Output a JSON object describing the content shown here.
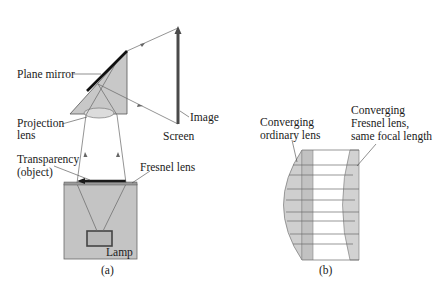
{
  "figure_a": {
    "caption": "(a)",
    "labels": {
      "plane_mirror": "Plane mirror",
      "projection_lens_1": "Projection",
      "projection_lens_2": "lens",
      "image": "Image",
      "screen": "Screen",
      "transparency_1": "Transparency",
      "transparency_2": "(object)",
      "fresnel_lens": "Fresnel lens",
      "lamp": "Lamp"
    }
  },
  "figure_b": {
    "caption": "(b)",
    "labels": {
      "ordinary_1": "Converging",
      "ordinary_2": "ordinary lens",
      "fresnel_1": "Converging",
      "fresnel_2": "Fresnel lens,",
      "fresnel_3": "same focal length"
    }
  },
  "colors": {
    "fill_gray": "#c8c8c8",
    "box_gray": "#bdbdbd",
    "line": "#555555",
    "dark": "#2a2a2a"
  }
}
